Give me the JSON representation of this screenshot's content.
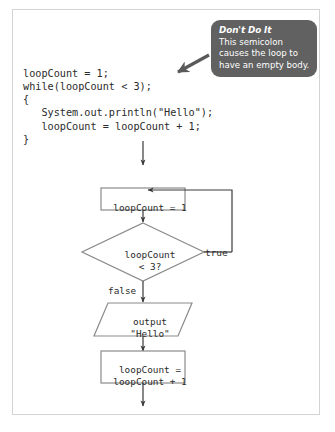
{
  "figure": {
    "code": {
      "lines": [
        "loopCount = 1;",
        "while(loopCount < 3);",
        "{",
        "   System.out.println(\"Hello\");",
        "   loopCount = loopCount + 1;",
        "}"
      ],
      "text": "loopCount = 1;\nwhile(loopCount < 3);\n{\n   System.out.println(\"Hello\");\n   loopCount = loopCount + 1;\n}"
    },
    "callout": {
      "title": "Don't Do It",
      "body": "This semicolon causes the loop to have an empty body."
    },
    "flowchart": {
      "nodes": [
        {
          "id": "init",
          "shape": "process",
          "text": "loopCount = 1"
        },
        {
          "id": "decision",
          "shape": "decision",
          "text": "loopCount\n< 3?"
        },
        {
          "id": "output",
          "shape": "parallelogram",
          "text": "output\n\"Hello\""
        },
        {
          "id": "increment",
          "shape": "process",
          "text": "loopCount =\nloopCount + 1"
        }
      ],
      "edge_labels": {
        "true": "true",
        "false": "false"
      }
    },
    "colors": {
      "callout_background": "#616161",
      "callout_text": "#ffffff",
      "code_text": "#2b2b2b",
      "shape_stroke": "#8a8a8a",
      "connector": "#3a3a3a",
      "arrow_pointer": "#555555",
      "frame_border": "#d3d3d3",
      "page_background": "#ffffff"
    }
  }
}
